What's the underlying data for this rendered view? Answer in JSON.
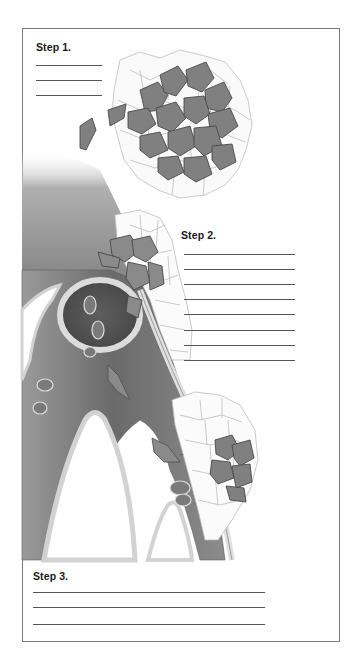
{
  "worksheet": {
    "steps": [
      {
        "label": "Step 1.",
        "line_count": 3
      },
      {
        "label": "Step 2.",
        "line_count": 8
      },
      {
        "label": "Step 3.",
        "line_count": 3
      }
    ]
  },
  "illustration": {
    "subject": "blood vessel with tumor cells invading surrounding tissue",
    "colors": {
      "tumor_cell": "#7d7d7d",
      "tumor_outline": "#4a4a4a",
      "vessel_dark": "#6e6e6e",
      "vessel_wall": "#d9d9d9",
      "tissue_cell_outline": "#b5b5b5"
    }
  }
}
